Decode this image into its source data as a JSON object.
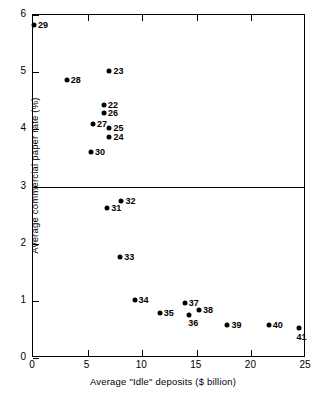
{
  "chart_data": {
    "type": "scatter",
    "title": "",
    "xlabel": "Average \"Idle\" deposits ($ billion)",
    "ylabel": "Average commercial paper rate (%)",
    "xlim": [
      0,
      25
    ],
    "ylim": [
      0,
      6
    ],
    "xticks": [
      0,
      5,
      10,
      15,
      20,
      25
    ],
    "yticks": [
      0,
      1,
      2,
      3,
      4,
      5,
      6
    ],
    "xtick_labels": [
      "0",
      "5",
      "10",
      "15",
      "20",
      "25"
    ],
    "ytick_labels": [
      "0",
      "1",
      "2",
      "3",
      "4",
      "5",
      "6"
    ],
    "grid": false,
    "legend": "none",
    "annotations": [
      {
        "label": "3.0 reference line",
        "type": "hline",
        "y": 3.0
      }
    ],
    "points": [
      {
        "label": "29",
        "x": 0.1,
        "y": 5.83,
        "label_pos": "right"
      },
      {
        "label": "28",
        "x": 3.1,
        "y": 4.87,
        "label_pos": "right"
      },
      {
        "label": "23",
        "x": 7.0,
        "y": 5.02,
        "label_pos": "right"
      },
      {
        "label": "22",
        "x": 6.5,
        "y": 4.42,
        "label_pos": "right"
      },
      {
        "label": "26",
        "x": 6.5,
        "y": 4.29,
        "label_pos": "right"
      },
      {
        "label": "27",
        "x": 5.5,
        "y": 4.1,
        "label_pos": "right"
      },
      {
        "label": "25",
        "x": 7.0,
        "y": 4.03,
        "label_pos": "right"
      },
      {
        "label": "24",
        "x": 7.0,
        "y": 3.87,
        "label_pos": "right"
      },
      {
        "label": "30",
        "x": 5.3,
        "y": 3.6,
        "label_pos": "right"
      },
      {
        "label": "32",
        "x": 8.1,
        "y": 2.74,
        "label_pos": "right"
      },
      {
        "label": "31",
        "x": 6.8,
        "y": 2.63,
        "label_pos": "right"
      },
      {
        "label": "33",
        "x": 8.0,
        "y": 1.77,
        "label_pos": "right"
      },
      {
        "label": "34",
        "x": 9.3,
        "y": 1.02,
        "label_pos": "right"
      },
      {
        "label": "35",
        "x": 11.6,
        "y": 0.78,
        "label_pos": "right"
      },
      {
        "label": "37",
        "x": 13.9,
        "y": 0.97,
        "label_pos": "right"
      },
      {
        "label": "36",
        "x": 14.3,
        "y": 0.76,
        "label_pos": "below-right"
      },
      {
        "label": "38",
        "x": 15.2,
        "y": 0.84,
        "label_pos": "right"
      },
      {
        "label": "39",
        "x": 17.8,
        "y": 0.57,
        "label_pos": "right"
      },
      {
        "label": "40",
        "x": 21.6,
        "y": 0.57,
        "label_pos": "right"
      },
      {
        "label": "41",
        "x": 24.4,
        "y": 0.52,
        "label_pos": "below"
      }
    ]
  }
}
